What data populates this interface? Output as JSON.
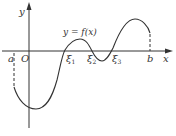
{
  "diagram": {
    "type": "function-graph",
    "function_label": "y = f(x)",
    "axes": {
      "x_label": "x",
      "y_label": "y",
      "origin_label": "O"
    },
    "interval": {
      "left_label": "a",
      "right_label": "b"
    },
    "roots": [
      {
        "label": "ξ",
        "subscript": "1"
      },
      {
        "label": "ξ",
        "subscript": "2"
      },
      {
        "label": "ξ",
        "subscript": "3"
      }
    ],
    "colors": {
      "stroke": "#333333",
      "background": "#ffffff"
    }
  }
}
